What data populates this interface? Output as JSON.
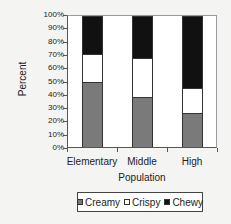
{
  "chart_data": {
    "type": "bar",
    "stacked": true,
    "percent": true,
    "title": "",
    "xlabel": "Population",
    "ylabel": "Percent",
    "categories": [
      "Elementary",
      "Middle",
      "High"
    ],
    "series": [
      {
        "name": "Creamy",
        "color": "#7a7a7a",
        "values": [
          50,
          38,
          26
        ]
      },
      {
        "name": "Crispy",
        "color": "#ffffff",
        "values": [
          21,
          30,
          19
        ]
      },
      {
        "name": "Chewy",
        "color": "#111111",
        "values": [
          29,
          32,
          55
        ]
      }
    ],
    "yticks": [
      "0%",
      "10%",
      "20%",
      "30%",
      "40%",
      "50%",
      "60%",
      "70%",
      "80%",
      "90%",
      "100%"
    ],
    "ylim": [
      0,
      100
    ],
    "grid": false,
    "legend_position": "bottom"
  },
  "legend": {
    "items": [
      {
        "label": "Creamy",
        "color": "#7a7a7a"
      },
      {
        "label": "Crispy",
        "color": "#ffffff"
      },
      {
        "label": "Chewy",
        "color": "#111111"
      }
    ]
  }
}
